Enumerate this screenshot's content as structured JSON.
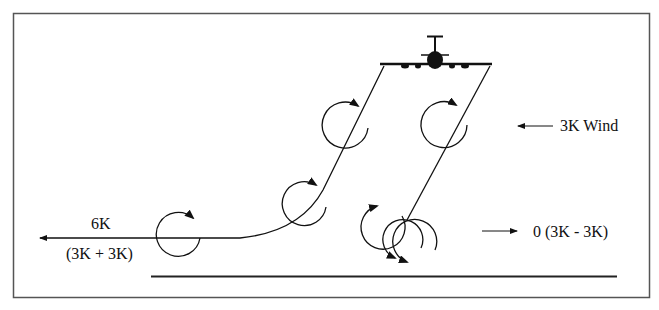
{
  "diagram": {
    "type": "wake vortex drift diagram",
    "colors": {
      "line": "#111111",
      "frame": "#555555",
      "background": "#ffffff"
    },
    "labels": {
      "wind": "3K Wind",
      "left_value": "6K",
      "left_formula": "(3K + 3K)",
      "right_value": "0 (3K - 3K)"
    },
    "icons": [
      "aircraft-icon",
      "vortex-rotation-icon",
      "arrow-left-icon",
      "arrow-right-icon"
    ]
  }
}
